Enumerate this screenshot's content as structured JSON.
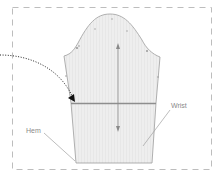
{
  "diagram": {
    "labels": {
      "hem": "Hem",
      "wrist": "Wrist"
    },
    "colors": {
      "background": "#ffffff",
      "border_dash": "#b5b5b5",
      "sleeve_fill": "#ececec",
      "sleeve_outline": "#9a9a9a",
      "fold_line": "#8c8c8c",
      "arrow": "#8a8a8a",
      "dotted_arrow": "#222222",
      "label_text": "#8a8a8a"
    },
    "icons": {
      "grainline": "double-headed-vertical-arrow",
      "fold_indicator": "curved-dotted-arrow"
    }
  }
}
